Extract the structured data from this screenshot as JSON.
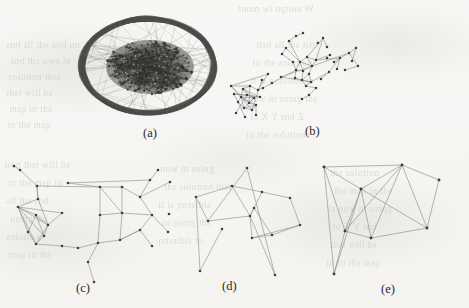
{
  "figure": {
    "name": "graph-layout-comparison-figure",
    "background_color": "#f7f6f4",
    "edge_color": "#8d8c89",
    "node_color": "#3f3e3c",
    "dense_ink_color": "#3a3937",
    "width": 469,
    "height": 308
  },
  "captions": {
    "a": "(a)",
    "b": "(b)",
    "c": "(c)",
    "d": "(d)",
    "e": "(e)"
  },
  "panels": [
    {
      "id": "a",
      "caption": "(a)",
      "type": "dense-hairball",
      "description": "Very dense graph drawn as a thick elliptical ring of overlapping edges with a solid filled inner ellipse of nodes",
      "center": [
        148,
        66
      ],
      "outer_rx": 66,
      "outer_ry": 47,
      "inner_rx": 44,
      "inner_ry": 27,
      "inner_center": [
        150,
        67
      ],
      "ring_strand_count": 46,
      "core_node_count": 260
    },
    {
      "id": "b",
      "caption": "(b)",
      "type": "sparse-clustered-graph",
      "description": "Two dense clusters joined by a bridge edge, with many degree-one leaf nodes radiating outward",
      "node_count": 58,
      "edge_count": 72
    },
    {
      "id": "c",
      "caption": "(c)",
      "type": "sparse-graph",
      "description": "Graph with one triangulated dense cluster at left and a grid-like region at right",
      "node_count": 24,
      "edge_count": 34
    },
    {
      "id": "d",
      "caption": "(d)",
      "type": "sparse-graph",
      "description": "Sparse graph of quadrilateral faces with four long pendant edges",
      "node_count": 15,
      "edge_count": 18
    },
    {
      "id": "e",
      "caption": "(e)",
      "type": "sparse-graph",
      "description": "Small graph of eight nodes with many crossing edges forming triangles",
      "node_count": 8,
      "edge_count": 16
    }
  ],
  "bleed_text": [
    {
      "text": "W uoitpu  iw moot",
      "x": 238,
      "y": 4
    },
    {
      "text": "ou  bsit  sdt  lls  bus",
      "x": 6,
      "y": 40
    },
    {
      "text": "ni  nwo  sdt  bns",
      "x": 10,
      "y": 56
    },
    {
      "text": "tsdt  noitulos",
      "x": 8,
      "y": 72
    },
    {
      "text": "sd  lliw  tsdt",
      "x": 6,
      "y": 88
    },
    {
      "text": "sdt  ni  qsm",
      "x": 9,
      "y": 104
    },
    {
      "text": "qsm  sdt  ot",
      "x": 7,
      "y": 120
    },
    {
      "text": "bsit  sdt  lls  bsit",
      "x": 256,
      "y": 40
    },
    {
      "text": "noitulos  sdt  ni",
      "x": 252,
      "y": 58
    },
    {
      "text": "ot  sldissoq  si  ti",
      "x": 250,
      "y": 76
    },
    {
      "text": "sdt  gnisu  ni  won",
      "x": 248,
      "y": 94
    },
    {
      "text": "Z  bns  Y  X  ot",
      "x": 250,
      "y": 112
    },
    {
      "text": "noitulos  sdt  ni",
      "x": 246,
      "y": 130
    },
    {
      "text": "sd  lliw  tsdt  noit",
      "x": 4,
      "y": 160
    },
    {
      "text": "ni  qsm  sdt  ot",
      "x": 8,
      "y": 178
    },
    {
      "text": "bns  sdt  lls",
      "x": 6,
      "y": 196
    },
    {
      "text": "sdt  gnisu",
      "x": 10,
      "y": 214
    },
    {
      "text": "noitulos",
      "x": 6,
      "y": 232
    },
    {
      "text": "sdt  ni  qsm",
      "x": 8,
      "y": 250
    },
    {
      "text": "gnisu  ni  won",
      "x": 160,
      "y": 164
    },
    {
      "text": "tsdt  noitulos  sdt",
      "x": 164,
      "y": 182
    },
    {
      "text": "sldissoq  si  ti",
      "x": 158,
      "y": 200
    },
    {
      "text": "sdt  gnisu  ni",
      "x": 162,
      "y": 218
    },
    {
      "text": "ot  sldissoq",
      "x": 158,
      "y": 236
    },
    {
      "text": "noitulos  sdt",
      "x": 330,
      "y": 168
    },
    {
      "text": "sdt  ni  qsm  sdt",
      "x": 334,
      "y": 186
    },
    {
      "text": "gnisu  ni  won  si",
      "x": 328,
      "y": 204
    },
    {
      "text": "bns  Y  X  ot",
      "x": 332,
      "y": 222
    },
    {
      "text": "sd  lliw  tsdt",
      "x": 330,
      "y": 240
    },
    {
      "text": "qsm  sdt  ot  ni",
      "x": 326,
      "y": 258
    }
  ]
}
